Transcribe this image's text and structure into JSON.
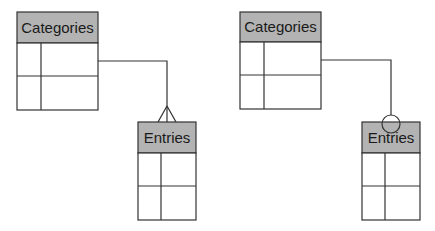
{
  "diagrams": [
    {
      "notation": "crows-foot-many",
      "parent": {
        "title": "Categories",
        "rows": 2,
        "cols": 2
      },
      "child": {
        "title": "Entries",
        "rows": 2,
        "cols": 2
      }
    },
    {
      "notation": "circle-optional",
      "parent": {
        "title": "Categories",
        "rows": 2,
        "cols": 2
      },
      "child": {
        "title": "Entries",
        "rows": 2,
        "cols": 2
      }
    }
  ],
  "colors": {
    "header_fill": "#b3b3b3",
    "line": "#333333",
    "cell_fill": "#ffffff"
  }
}
